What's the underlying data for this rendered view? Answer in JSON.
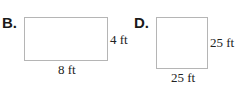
{
  "figures": [
    {
      "label": "B.",
      "shape": "rectangle",
      "width_label": "8 ft",
      "height_label": "4 ft"
    },
    {
      "label": "D.",
      "shape": "square",
      "width_label": "25 ft",
      "height_label": "25 ft"
    }
  ],
  "colors": {
    "outline": "#b5b5b5",
    "text": "#222222"
  }
}
